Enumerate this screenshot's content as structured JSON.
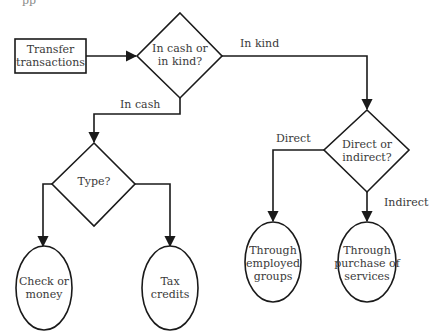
{
  "top_fragment": "pp",
  "nodes": {
    "start": {
      "line1": "Transfer",
      "line2": "transactions"
    },
    "decision_cash_kind": {
      "line1": "In cash or",
      "line2": "in kind?"
    },
    "decision_type": {
      "line1": "Type?"
    },
    "decision_direct": {
      "line1": "Direct or",
      "line2": "indirect?"
    },
    "check_money": {
      "line1": "Check or",
      "line2": "money"
    },
    "tax_credits": {
      "line1": "Tax",
      "line2": "credits"
    },
    "employed_groups": {
      "line1": "Through",
      "line2": "employed",
      "line3": "groups"
    },
    "purchase_services": {
      "line1": "Through",
      "line2": "purchase of",
      "line3": "services"
    }
  },
  "edges": {
    "in_kind": "In kind",
    "in_cash": "In cash",
    "direct": "Direct",
    "indirect": "Indirect"
  },
  "colors": {
    "stroke": "#1a1a1a",
    "text": "#3a3a3a",
    "background": "#ffffff"
  }
}
